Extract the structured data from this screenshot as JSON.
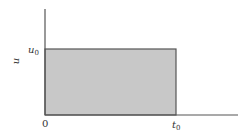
{
  "figure": {
    "type": "rectangular pulse",
    "y_axis_label": "u",
    "y_level_label": {
      "base": "u",
      "subscript": "0"
    },
    "x_end_label": {
      "base": "t",
      "subscript": "0"
    },
    "origin_label": "0",
    "colors": {
      "fill": "#c8c8c8",
      "stroke": "#555555",
      "axis": "#555555"
    }
  }
}
